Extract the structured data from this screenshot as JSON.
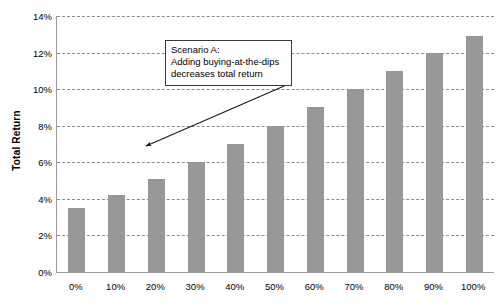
{
  "chart_data": {
    "type": "bar",
    "title": "",
    "xlabel": "",
    "ylabel": "Total Return",
    "categories": [
      "0%",
      "10%",
      "20%",
      "30%",
      "40%",
      "50%",
      "60%",
      "70%",
      "80%",
      "90%",
      "100%"
    ],
    "values": [
      3.5,
      4.2,
      5.1,
      6.0,
      7.0,
      8.0,
      9.0,
      10.0,
      11.0,
      12.0,
      12.9
    ],
    "value_unit": "%",
    "ylim": [
      0,
      14
    ],
    "ytick_step": 2,
    "ytick_labels": [
      "0%",
      "2%",
      "4%",
      "6%",
      "8%",
      "10%",
      "12%",
      "14%"
    ],
    "grid": true,
    "grid_style": "dashed",
    "legend": "none",
    "bar_color": "#989898",
    "grid_color": "#8c8c99",
    "axis_color": "#9a9a9a",
    "annotations": [
      {
        "name": "scenario-a-callout",
        "lines": [
          "Scenario A:",
          "Adding buying-at-the-dips",
          "decreases total return"
        ],
        "arrow_points_to_x": "20%",
        "arrow_points_to_y": 7.0
      }
    ]
  }
}
